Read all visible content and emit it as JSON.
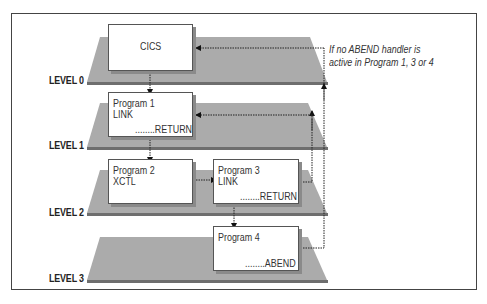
{
  "diagram": {
    "levels": [
      {
        "label": "LEVEL 0"
      },
      {
        "label": "LEVEL 1"
      },
      {
        "label": "LEVEL 2"
      },
      {
        "label": "LEVEL 3"
      }
    ],
    "boxes": {
      "cics": {
        "title": "CICS"
      },
      "program1": {
        "title": "Program 1",
        "line2": "LINK",
        "footer": "........RETURN"
      },
      "program2": {
        "title": "Program 2",
        "line2": "XCTL"
      },
      "program3": {
        "title": "Program 3",
        "line2": "LINK",
        "footer": "........RETURN"
      },
      "program4": {
        "title": "Program 4",
        "footer": "........ABEND"
      }
    },
    "note": {
      "line1": "If no ABEND handler is",
      "line2": "active in Program 1, 3 or 4"
    },
    "colors": {
      "plane": "#a9a9a9",
      "plane_edge": "#6e6e6e",
      "frame": "#444444"
    }
  }
}
